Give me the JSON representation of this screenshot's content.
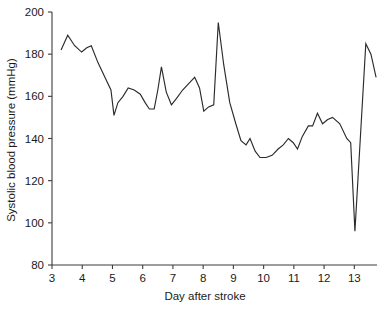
{
  "chart_data": {
    "type": "line",
    "title": "",
    "subtitle": "",
    "xlabel": "Day after stroke",
    "ylabel": "Systolic blood pressure (mmHg)",
    "xlim": [
      3,
      13.75
    ],
    "ylim": [
      80,
      200
    ],
    "xticks": [
      3,
      4,
      5,
      6,
      7,
      8,
      9,
      10,
      11,
      12,
      13
    ],
    "xticklabels": [
      "3",
      "4",
      "5",
      "6",
      "7",
      "8",
      "9",
      "10",
      "11",
      "12",
      "13"
    ],
    "yticks": [
      80,
      100,
      120,
      140,
      160,
      180,
      200
    ],
    "yticklabels": [
      "80",
      "100",
      "120",
      "140",
      "160",
      "180",
      "200"
    ],
    "grid": false,
    "legend": false,
    "legend_position": "none",
    "line_color": "#2b2b2b",
    "series": [
      {
        "name": "Systolic blood pressure",
        "x": [
          3.3,
          3.52,
          3.75,
          3.98,
          4.15,
          4.3,
          4.52,
          4.75,
          4.95,
          5.05,
          5.18,
          5.35,
          5.52,
          5.72,
          5.92,
          6.08,
          6.22,
          6.38,
          6.5,
          6.62,
          6.78,
          6.95,
          7.12,
          7.32,
          7.52,
          7.72,
          7.88,
          8.02,
          8.18,
          8.35,
          8.5,
          8.68,
          8.88,
          9.08,
          9.25,
          9.42,
          9.55,
          9.72,
          9.88,
          10.08,
          10.28,
          10.48,
          10.65,
          10.82,
          10.98,
          11.12,
          11.28,
          11.48,
          11.62,
          11.78,
          11.95,
          12.12,
          12.28,
          12.52,
          12.75,
          12.88,
          13.02,
          13.38,
          13.55,
          13.72
        ],
        "y": [
          182,
          189,
          184,
          181,
          183,
          184,
          176,
          169,
          163,
          151,
          157,
          160,
          164,
          163,
          161,
          157,
          154,
          154,
          163,
          174,
          162,
          156,
          159,
          163,
          166,
          169,
          164,
          153,
          155,
          156,
          195,
          175,
          157,
          147,
          139,
          137,
          140,
          134,
          131,
          131,
          132,
          135,
          137,
          140,
          138,
          135,
          141,
          146,
          146,
          152,
          147,
          149,
          150,
          147,
          140,
          138,
          96,
          185,
          180,
          169
        ]
      }
    ]
  },
  "axis": {
    "x_title": "Day after stroke",
    "y_title": "Systolic blood pressure (mmHg)"
  }
}
